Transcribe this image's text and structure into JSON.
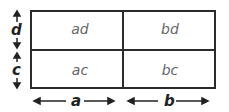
{
  "cells": {
    "top_left": "ad",
    "top_right": "bd",
    "bottom_left": "ac",
    "bottom_right": "bc"
  },
  "dimensions": {
    "left_top": "d",
    "left_bottom": "c",
    "bottom_left": "a",
    "bottom_right": "b"
  }
}
